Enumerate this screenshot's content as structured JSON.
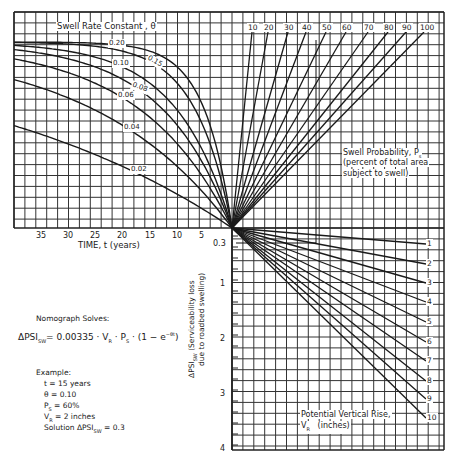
{
  "chart_data": {
    "type": "nomograph",
    "panels": {
      "time_panel": {
        "title": "Swell Rate Constant, θ",
        "xlabel": "TIME, t   (years)",
        "x_ticks": [
          "35",
          "30",
          "25",
          "20",
          "15",
          "10",
          "5"
        ],
        "curves": [
          {
            "theta": "0.20",
            "label": "0.20"
          },
          {
            "theta": "0.15",
            "label": "0.15"
          },
          {
            "theta": "0.10",
            "label": "0.10"
          },
          {
            "theta": "0.08",
            "label": "0.08"
          },
          {
            "theta": "0.06",
            "label": "0.06"
          },
          {
            "theta": "0.04",
            "label": "0.04"
          },
          {
            "theta": "0.02",
            "label": "0.02"
          }
        ]
      },
      "probability_panel": {
        "title": "Swell Probability, Ps",
        "subtitle_lines": [
          "(percent of total area",
          "subject to swell)"
        ],
        "lines": [
          "10",
          "20",
          "30",
          "40",
          "50",
          "60",
          "70",
          "80",
          "90",
          "100"
        ]
      },
      "vr_panel": {
        "title_lines": [
          "Potential Vertical Rise,",
          "VR   (inches)"
        ],
        "lines": [
          "1",
          "2",
          "3",
          "4",
          "5",
          "6",
          "7",
          "8",
          "9",
          "10"
        ]
      },
      "psi_scale": {
        "label_lines": [
          "ΔPSI_SW  (Serviceability loss",
          "due to roadbed swelling)"
        ],
        "ticks": [
          "0.3",
          "1",
          "2",
          "3",
          "4"
        ]
      }
    },
    "formula": {
      "heading": "Nomograph Solves:",
      "equation": "ΔPSI_SW = 0.00335 · VR · Ps · (1 − e^−θt)"
    },
    "example": {
      "heading": "Example:",
      "lines": [
        "t = 15 years",
        "θ = 0.10",
        "Ps = 60%",
        "VR = 2 inches",
        "Solution  ΔPSI_SW = 0.3"
      ]
    }
  },
  "labels": {
    "time_title": "Swell Rate Constant ,  θ",
    "theta": [
      "0.20",
      "0.15",
      "0.10",
      "0.08",
      "0.06",
      "0.04",
      "0.02"
    ],
    "time_ticks": [
      "35",
      "30",
      "25",
      "20",
      "15",
      "10",
      "5"
    ],
    "time_axis": "TIME,  t      (years)",
    "ps_ticks": [
      "10",
      "20",
      "30",
      "40",
      "50",
      "60",
      "70",
      "80",
      "90",
      "100"
    ],
    "ps_title_1": "Swell Probability,  P",
    "ps_title_sub": "s",
    "ps_title_2": "(percent of total area",
    "ps_title_3": "subject to swell)",
    "vr_ticks": [
      "1",
      "2",
      "3",
      "4",
      "5",
      "6",
      "7",
      "8",
      "9",
      "10"
    ],
    "vr_title_1": "Potential  Vertical  Rise,",
    "vr_title_2": "V",
    "vr_title_sub": "R",
    "vr_title_3": "(inches)",
    "psi_ticks": [
      "0.3",
      "1",
      "2",
      "3",
      "4"
    ],
    "psi_label_1": "ΔPSI",
    "psi_label_sub": "SW",
    "psi_label_2": "(Serviceability loss",
    "psi_label_3": "due to roadbed swelling)",
    "formula_heading": "Nomograph Solves:",
    "formula_lhs": "ΔPSI",
    "formula_lhs_sub": "SW",
    "formula_rhs": "= 0.00335 · V",
    "formula_vr_sub": "R",
    "formula_mid": " · P",
    "formula_ps_sub": "S",
    "formula_tail": " · (1 − e",
    "formula_exp": "−θt",
    "formula_close": ")",
    "example_heading": "Example:",
    "example_t": "t = 15 years",
    "example_theta": "θ = 0.10",
    "example_ps": "P",
    "example_ps_sub": "S",
    "example_ps_val": " = 60%",
    "example_vr": "V",
    "example_vr_sub": "R",
    "example_vr_val": " = 2 inches",
    "example_solution": "Solution  ΔPSI",
    "example_solution_sub": "SW",
    "example_solution_val": " = 0.3"
  }
}
